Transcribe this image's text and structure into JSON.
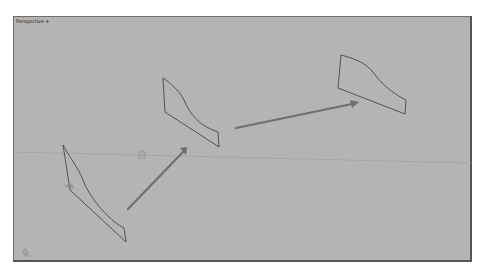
{
  "viewport": {
    "label": "Perspective",
    "label_suffix": "+",
    "background": "#b4b4b4",
    "horizon_color": "#9a9a9a",
    "outline_color": "#3a3a3a",
    "arrow_color": "#6f6f6f"
  },
  "scene": {
    "objects": [
      {
        "name": "profile-shape-1",
        "type": "curved-quad-outline"
      },
      {
        "name": "profile-shape-2",
        "type": "curved-quad-outline"
      },
      {
        "name": "profile-shape-3",
        "type": "curved-quad-outline"
      },
      {
        "name": "direction-arrow-1",
        "type": "arrow"
      },
      {
        "name": "direction-arrow-2",
        "type": "arrow"
      }
    ],
    "pivot_marker": "pivot-gizmo",
    "axis_gizmo": "world-axis-tripod"
  }
}
